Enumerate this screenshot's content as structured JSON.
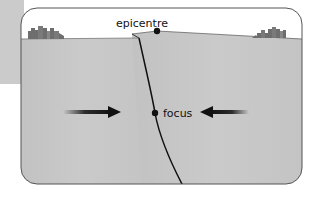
{
  "diagram": {
    "type": "earthquake cross-section",
    "labels": {
      "epicentre": "epicentre",
      "focus": "focus"
    },
    "colors": {
      "rock": "#c6c6c6",
      "sky": "#ffffff",
      "outline": "#555555",
      "fault_line": "#111111",
      "arrow": "#111111",
      "buildings": "#6e6e6e"
    },
    "elements": [
      {
        "name": "fault-line",
        "description": "inclined fault from surface to bottom, passing through focus"
      },
      {
        "name": "epicentre-point",
        "description": "dot on surface directly above focus"
      },
      {
        "name": "focus-point",
        "description": "dot on fault line at depth"
      },
      {
        "name": "compression-arrow-left",
        "direction": "right"
      },
      {
        "name": "compression-arrow-right",
        "direction": "left"
      },
      {
        "name": "city-left",
        "description": "building silhouettes on left surface"
      },
      {
        "name": "city-right",
        "description": "building silhouettes on right surface"
      }
    ]
  }
}
